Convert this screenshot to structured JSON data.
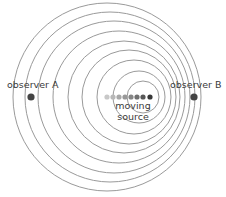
{
  "diagram": {
    "wave_color": "#9a9a9a",
    "observer_color": "#444444",
    "label_color": "#3a3a3a",
    "wavefronts": [
      {
        "cx": 107,
        "cy": 97,
        "r": 94
      },
      {
        "cx": 110,
        "cy": 97,
        "r": 85
      },
      {
        "cx": 114,
        "cy": 97,
        "r": 76
      },
      {
        "cx": 119,
        "cy": 97,
        "r": 66
      },
      {
        "cx": 124,
        "cy": 97,
        "r": 56
      },
      {
        "cx": 129,
        "cy": 97,
        "r": 47
      },
      {
        "cx": 134,
        "cy": 97,
        "r": 37
      },
      {
        "cx": 139,
        "cy": 97,
        "r": 26
      },
      {
        "cx": 143,
        "cy": 97,
        "r": 16
      }
    ],
    "source_positions": [
      {
        "cx": 107,
        "cy": 97,
        "color": "#c8c8c8"
      },
      {
        "cx": 113,
        "cy": 97,
        "color": "#b8b8b8"
      },
      {
        "cx": 119,
        "cy": 97,
        "color": "#a8a8a8"
      },
      {
        "cx": 125,
        "cy": 97,
        "color": "#989898"
      },
      {
        "cx": 131,
        "cy": 97,
        "color": "#868686"
      },
      {
        "cx": 137,
        "cy": 97,
        "color": "#707070"
      },
      {
        "cx": 143,
        "cy": 97,
        "color": "#585858"
      },
      {
        "cx": 150,
        "cy": 97,
        "color": "#383838"
      }
    ],
    "observer_a": {
      "label": "observer A",
      "cx": 31,
      "cy": 97
    },
    "observer_b": {
      "label": "observer B",
      "cx": 194,
      "cy": 97
    },
    "source_label_line1": "moving",
    "source_label_line2": "source"
  }
}
